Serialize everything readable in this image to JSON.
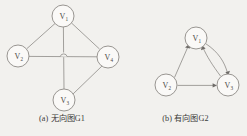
{
  "figure": {
    "background_color": "#f2f1ee",
    "ink_color": "#8d8a86"
  },
  "panel_a": {
    "caption": "(a) 无向图G1",
    "graph_type": "undirected",
    "nodes": [
      {
        "id": "v1",
        "label": "V",
        "subscript": "1",
        "cx": 63,
        "cy": 16,
        "r": 11
      },
      {
        "id": "v2",
        "label": "V",
        "subscript": "2",
        "cx": 18,
        "cy": 56,
        "r": 11
      },
      {
        "id": "v4",
        "label": "V",
        "subscript": "4",
        "cx": 108,
        "cy": 57,
        "r": 11
      },
      {
        "id": "v3",
        "label": "V",
        "subscript": "3",
        "cx": 64,
        "cy": 100,
        "r": 11
      }
    ],
    "edges": [
      {
        "from": "v1",
        "to": "v2"
      },
      {
        "from": "v1",
        "to": "v4"
      },
      {
        "from": "v1",
        "to": "v3"
      },
      {
        "from": "v2",
        "to": "v4"
      },
      {
        "from": "v3",
        "to": "v4"
      }
    ]
  },
  "panel_b": {
    "caption": "(b) 有向图G2",
    "graph_type": "directed",
    "nodes": [
      {
        "id": "v1",
        "label": "V",
        "subscript": "1",
        "cx": 72,
        "cy": 38,
        "r": 11
      },
      {
        "id": "v2",
        "label": "V",
        "subscript": "2",
        "cx": 42,
        "cy": 85,
        "r": 11
      },
      {
        "id": "v3",
        "label": "V",
        "subscript": "3",
        "cx": 104,
        "cy": 85,
        "r": 11
      }
    ],
    "edges": [
      {
        "from": "v2",
        "to": "v1",
        "style": "straight"
      },
      {
        "from": "v2",
        "to": "v3",
        "style": "straight"
      },
      {
        "from": "v1",
        "to": "v3",
        "style": "curved"
      },
      {
        "from": "v3",
        "to": "v1",
        "style": "curved"
      }
    ]
  }
}
